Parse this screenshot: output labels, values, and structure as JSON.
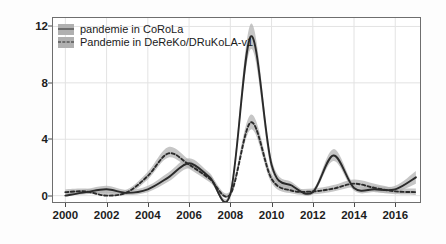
{
  "chart_data": {
    "type": "line",
    "title": "",
    "subtitle": "",
    "xlabel": "",
    "ylabel": "Instanzen pro Millionen",
    "xlim": [
      1999.4,
      2017.2
    ],
    "ylim": [
      -0.45,
      12.6
    ],
    "yticks": [
      0,
      4,
      8,
      12
    ],
    "ytick_labels": [
      "0",
      "4",
      "8",
      "12"
    ],
    "xticks": [
      2000,
      2002,
      2004,
      2006,
      2008,
      2010,
      2012,
      2014,
      2016
    ],
    "xtick_labels": [
      "2000",
      "2002",
      "2004",
      "2006",
      "2008",
      "2010",
      "2012",
      "2014",
      "2016"
    ],
    "grid": true,
    "grid_color": "#e3e3e3",
    "panel_background": "#ffffff",
    "panel_border_color": "#6e6e6e",
    "legend_position": "top-left",
    "ribbon_color": "#b0b0b0",
    "line_color": "#2a2a2a",
    "x": [
      2000,
      2001,
      2002,
      2003,
      2004,
      2005,
      2006,
      2007,
      2008,
      2009,
      2010,
      2011,
      2012,
      2013,
      2014,
      2015,
      2016,
      2017
    ],
    "series": [
      {
        "name": "pandemie in CoRoLa",
        "style": "solid",
        "values": [
          0.0,
          0.25,
          0.45,
          0.2,
          0.45,
          1.3,
          2.3,
          1.3,
          0.1,
          11.3,
          2.2,
          0.7,
          0.25,
          2.85,
          0.55,
          0.45,
          0.45,
          1.3
        ],
        "ci_lower": [
          0.0,
          0.1,
          0.2,
          0.05,
          0.25,
          1.0,
          1.95,
          1.05,
          0.0,
          10.4,
          1.8,
          0.45,
          0.1,
          2.45,
          0.35,
          0.25,
          0.25,
          0.85
        ],
        "ci_upper": [
          0.2,
          0.45,
          0.7,
          0.4,
          0.7,
          1.65,
          2.65,
          1.6,
          0.35,
          12.2,
          2.6,
          0.95,
          0.45,
          3.3,
          0.8,
          0.7,
          0.7,
          1.75
        ]
      },
      {
        "name": "Pandemie in DeReKo/DRuKoLA-v1",
        "style": "dashed",
        "values": [
          0.25,
          0.3,
          0.0,
          0.25,
          1.4,
          3.0,
          2.2,
          1.2,
          0.1,
          5.2,
          1.2,
          0.35,
          0.3,
          0.5,
          0.85,
          0.55,
          0.3,
          0.25
        ],
        "ci_lower": [
          0.1,
          0.15,
          0.0,
          0.1,
          1.15,
          2.7,
          1.9,
          0.95,
          0.0,
          4.7,
          0.9,
          0.15,
          0.1,
          0.3,
          0.6,
          0.3,
          0.1,
          0.05
        ],
        "ci_upper": [
          0.45,
          0.5,
          0.3,
          0.45,
          1.7,
          3.45,
          2.55,
          1.5,
          0.35,
          5.75,
          1.55,
          0.6,
          0.5,
          0.75,
          1.15,
          0.85,
          0.55,
          0.5
        ]
      }
    ]
  },
  "legend": {
    "items": [
      {
        "label": "pandemie in CoRoLa",
        "style": "solid"
      },
      {
        "label": "Pandemie in DeReKo/DRuKoLA-v1",
        "style": "dashed"
      }
    ]
  },
  "axes": {
    "y_title": "Instanzen pro Millionen"
  }
}
